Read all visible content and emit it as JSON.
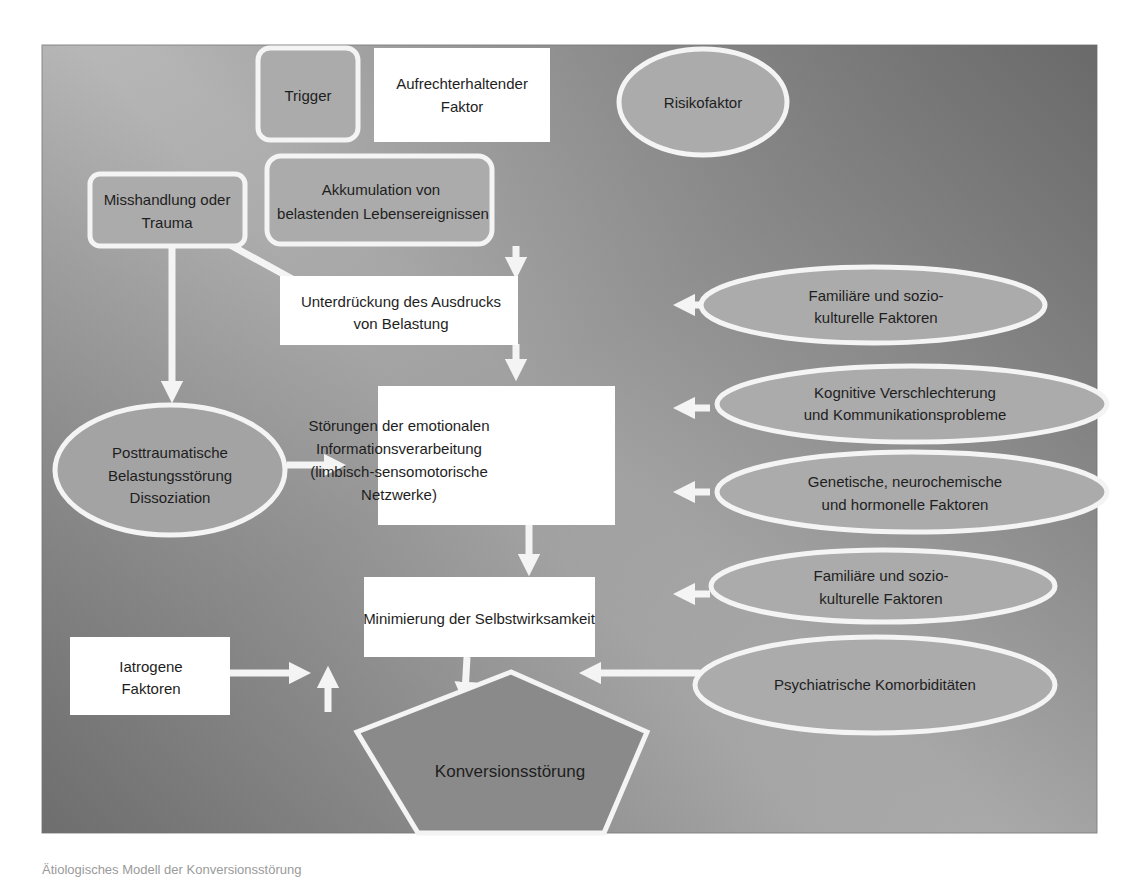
{
  "diagram": {
    "colors": {
      "frame_light": "#c4c4c4",
      "frame_dark": "#6c6c6c",
      "node_fill_gray": "#a9a9a9",
      "node_fill_white": "#ffffff",
      "pentagon_fill": "#8b8b8b",
      "stroke": "#f4f4f4",
      "text": "#1e1e1e"
    },
    "legend": {
      "trigger": "Trigger",
      "maintaining_factor": [
        "Aufrechterhaltender",
        "Faktor"
      ],
      "risk_factor": "Risikofaktor"
    },
    "nodes": {
      "misshandlung": [
        "Misshandlung oder",
        "Trauma"
      ],
      "akkumulation": [
        "Akkumulation von",
        "belastenden Lebensereignissen"
      ],
      "unterdrueckung": [
        "Unterdrückung des Ausdrucks",
        "von Belastung"
      ],
      "familiaere_1": [
        "Familiäre und sozio-",
        "kulturelle Faktoren"
      ],
      "kognitive": [
        "Kognitive Verschlechterung",
        "und Kommunikationsprobleme"
      ],
      "posttraumatische": [
        "Posttraumatische",
        "Belastungsstörung",
        "Dissoziation"
      ],
      "stoerungen": [
        "Störungen der emotionalen",
        "Informationsverarbeitung",
        "(limbisch-sensomotorische",
        "Netzwerke)"
      ],
      "genetische": [
        "Genetische, neurochemische",
        "und hormonelle Faktoren"
      ],
      "familiaere_2": [
        "Familiäre und sozio-",
        "kulturelle Faktoren"
      ],
      "minimierung": [
        "Minimierung der Selbstwirksamkeit"
      ],
      "iatrogene": [
        "Iatrogene",
        "Faktoren"
      ],
      "psychiatrische": [
        "Psychiatrische Komorbiditäten"
      ],
      "konversion": [
        "Konversionsstörung"
      ]
    }
  },
  "caption": "Ätiologisches Modell der Konversionsstörung"
}
